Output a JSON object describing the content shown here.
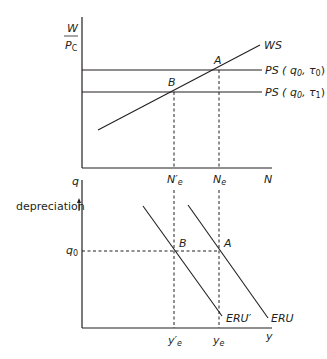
{
  "top_panel": {
    "y_axis_label_num": "W",
    "y_axis_label_den": "P",
    "y_axis_label_den_sub": "C",
    "x_axis_label": "N",
    "curves": {
      "ws": "WS",
      "ps0": "PS ( q",
      "ps0_sub": "0",
      "ps0_tau": ", τ",
      "ps0_tau_sub": "0",
      "ps0_close": ")",
      "ps1": "PS ( q",
      "ps1_sub": "0",
      "ps1_tau": ", τ",
      "ps1_tau_sub": "1",
      "ps1_close": ")"
    },
    "points": {
      "a": "A",
      "b": "B"
    },
    "x_ticks": {
      "ne_prime": "N′",
      "ne_prime_sub": "e",
      "ne": "N",
      "ne_sub": "e"
    }
  },
  "bottom_panel": {
    "y_axis_label": "q",
    "direction_label": "depreciation",
    "direction_arrow": "↑",
    "q0_label": "q",
    "q0_sub": "0",
    "x_axis_label": "y",
    "curves": {
      "eru": "ERU",
      "eru_prime": "ERU′"
    },
    "points": {
      "a": "A",
      "b": "B"
    },
    "x_ticks": {
      "ye_prime": "y′",
      "ye_prime_sub": "e",
      "ye": "y",
      "ye_sub": "e"
    }
  },
  "colors": {
    "line": "#231f20",
    "background": "#ffffff"
  }
}
